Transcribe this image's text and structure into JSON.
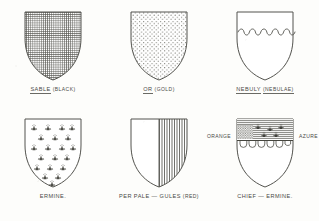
{
  "plate": {
    "title": "Heraldic tinctures and partitions plate",
    "background_color": "#fdfdfb",
    "ink_color": "#4a4a46",
    "rows": 2,
    "columns": 3
  },
  "shields": [
    {
      "id": "sable",
      "row": 1,
      "column": 1,
      "pattern": "crosshatch",
      "pattern_description": "dense vertical and horizontal crosshatch covering the whole field",
      "caption_main": "SABLE",
      "caption_paren": "(BLACK)",
      "caption_underlined": true
    },
    {
      "id": "or",
      "row": 1,
      "column": 2,
      "pattern": "dots",
      "pattern_description": "regular field of small dots covering the whole field",
      "caption_main": "OR",
      "caption_paren": "(GOLD)",
      "caption_underlined": true
    },
    {
      "id": "nebuly",
      "row": 1,
      "column": 3,
      "pattern": "nebuly-line",
      "pattern_description": "plain field divided by a cloud-shaped nebuly line across the upper third",
      "caption_main": "NEBULY",
      "caption_paren": "(NEBULAE)",
      "caption_underlined": true
    },
    {
      "id": "ermine",
      "row": 2,
      "column": 1,
      "pattern": "ermine-spots",
      "pattern_description": "plain field strewn with staggered rows of ermine spots",
      "caption_main": "ERMINE.",
      "caption_paren": "",
      "caption_underlined": false
    },
    {
      "id": "per-pale-gules",
      "row": 2,
      "column": 2,
      "pattern": "per-pale-vertical-lines",
      "pattern_description": "field parted per pale, dexter half plain, sinister half filled with vertical gules hatching",
      "caption_main": "PER PALE — GULES",
      "caption_paren": "(RED)",
      "caption_underlined": false
    },
    {
      "id": "chief-ermine",
      "row": 2,
      "column": 3,
      "pattern": "chief-ermine",
      "pattern_description": "chief charged with ermine spots over horizontal azure hatching, stippled panel at dexter and a row of arched shapes below",
      "caption_main": "CHIEF — ERMINE.",
      "caption_paren": "",
      "caption_underlined": false,
      "annotation_left": "ORANGE",
      "annotation_right": "AZURE",
      "annotation_right_paren": "(BLUE)"
    }
  ]
}
